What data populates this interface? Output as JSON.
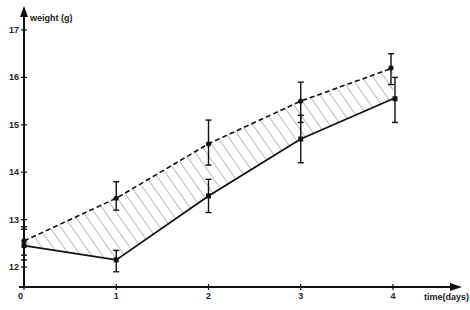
{
  "chart_data": {
    "type": "line",
    "title": "",
    "xlabel": "time (days)",
    "ylabel": "weight (g)",
    "x": [
      0,
      1,
      2,
      3,
      4
    ],
    "x_ticks": [
      "0",
      "1",
      "2",
      "3",
      "4"
    ],
    "y_ticks": [
      "12",
      "13",
      "14",
      "15",
      "16",
      "17"
    ],
    "xlim": [
      0,
      4.8
    ],
    "ylim": [
      11.6,
      17.4
    ],
    "grid": false,
    "legend": null,
    "series": [
      {
        "name": "upper (dashed)",
        "style": "dashed",
        "marker": "circle",
        "values": [
          12.55,
          13.45,
          14.6,
          15.5,
          16.2
        ],
        "error": [
          [
            12.25,
            12.85
          ],
          [
            13.2,
            13.8
          ],
          [
            14.15,
            15.1
          ],
          [
            15.05,
            15.9
          ],
          [
            15.85,
            16.5
          ]
        ]
      },
      {
        "name": "lower (solid)",
        "style": "solid",
        "marker": "square",
        "values": [
          12.45,
          12.15,
          13.5,
          14.7,
          15.55
        ],
        "error": [
          [
            12.15,
            12.8
          ],
          [
            11.9,
            12.35
          ],
          [
            13.15,
            13.85
          ],
          [
            14.2,
            15.2
          ],
          [
            15.05,
            16.0
          ]
        ]
      }
    ],
    "annotations": [
      "hatched region between the two curves"
    ]
  },
  "axes": {
    "y_label": "weight (g)",
    "x_label": "time(days)"
  }
}
